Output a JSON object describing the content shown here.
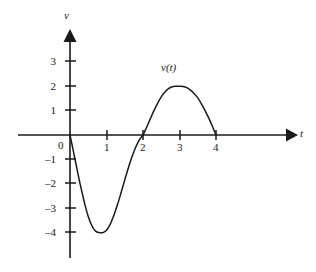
{
  "chart_data": {
    "type": "line",
    "title": "",
    "subtitle": "",
    "xlabel": "t",
    "ylabel": "v",
    "curve_label": "v(t)",
    "xlim": [
      -0.45,
      5.8
    ],
    "ylim": [
      -5.0,
      4.2
    ],
    "grid": false,
    "legend": null,
    "x_ticks": [
      1,
      2,
      3,
      4
    ],
    "x_tick_labels": [
      "1",
      "2",
      "3",
      "4"
    ],
    "y_ticks": [
      3,
      2,
      1,
      0,
      -1,
      -2,
      -3,
      -4
    ],
    "y_tick_labels": [
      "3",
      "2",
      "1",
      "0",
      "–1",
      "–2",
      "–3",
      "–4"
    ],
    "origin_label": "0",
    "axis_arrows": [
      "x-positive",
      "y-positive"
    ],
    "annotations": [
      {
        "text": "v(t)",
        "x": 3.0,
        "y": 2.9
      }
    ],
    "series": [
      {
        "name": "v(t)",
        "color": "#1a1a1a",
        "x": [
          0.0,
          0.1,
          0.2,
          0.3,
          0.4,
          0.5,
          0.6,
          0.7,
          0.8,
          0.9,
          1.0,
          1.1,
          1.2,
          1.3,
          1.4,
          1.5,
          1.6,
          1.7,
          1.8,
          1.9,
          2.0,
          2.1,
          2.2,
          2.3,
          2.4,
          2.5,
          2.6,
          2.7,
          2.8,
          2.9,
          3.0,
          3.1,
          3.2,
          3.3,
          3.4,
          3.5,
          3.6,
          3.7,
          3.8,
          3.9,
          4.0
        ],
        "y": [
          0.0,
          -0.72,
          -1.46,
          -2.16,
          -2.8,
          -3.34,
          -3.72,
          -3.94,
          -4.0,
          -4.0,
          -3.9,
          -3.66,
          -3.3,
          -2.86,
          -2.36,
          -1.84,
          -1.34,
          -0.88,
          -0.5,
          -0.2,
          0.0,
          0.32,
          0.66,
          1.0,
          1.3,
          1.56,
          1.76,
          1.9,
          1.98,
          2.0,
          2.0,
          1.99,
          1.94,
          1.84,
          1.7,
          1.52,
          1.28,
          1.0,
          0.7,
          0.36,
          0.0
        ]
      }
    ],
    "key_points": [
      {
        "label": "start / root",
        "t": 0,
        "v": 0
      },
      {
        "label": "minimum",
        "t": 0.85,
        "v": -4
      },
      {
        "label": "root",
        "t": 2,
        "v": 0
      },
      {
        "label": "maximum",
        "t": 3.05,
        "v": 2
      },
      {
        "label": "root / end",
        "t": 4,
        "v": 0
      }
    ]
  },
  "axes": {
    "y_axis_label": "v",
    "x_axis_label": "t"
  }
}
